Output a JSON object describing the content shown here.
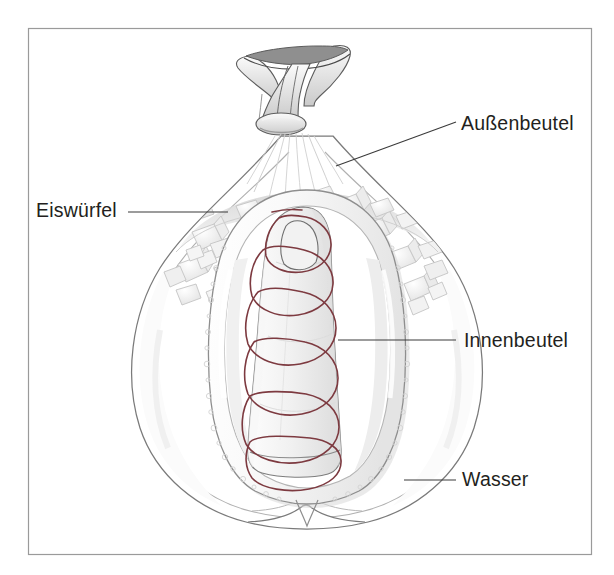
{
  "figure": {
    "name": "replantation-transport-bag-diagram",
    "description_title": "Transport eines Amputats im Doppelbeutel",
    "frame": {
      "border_color": "#9a9a9a",
      "background_color": "#ffffff",
      "x": 28,
      "y": 28,
      "width": 564,
      "height": 527
    },
    "colors": {
      "ink": "#231f20",
      "line": "#6e6e6e",
      "outer_bag_line": "#8a8a8a",
      "inner_bag_line": "#9c9c9c",
      "ice_fill": "#f2f2f2",
      "ice_line": "#c9c9c9",
      "spiral_wrap": "#7d3a40",
      "shadow": "#d8d8d8",
      "bubble": "#e6e6e6"
    },
    "labels": [
      {
        "id": "aussenbeutel",
        "text": "Außenbeutel",
        "target": "outer-bag",
        "leader": {
          "x1": 336,
          "y1": 166,
          "x2": 456,
          "y2": 122
        }
      },
      {
        "id": "eiswuerfel",
        "text": "Eiswürfel",
        "target": "ice-cubes",
        "leader": {
          "x1": 128,
          "y1": 212,
          "x2": 228,
          "y2": 212
        }
      },
      {
        "id": "innenbeutel",
        "text": "Innenbeutel",
        "target": "inner-bag",
        "leader": {
          "x1": 338,
          "y1": 340,
          "x2": 456,
          "y2": 340
        }
      },
      {
        "id": "wasser",
        "text": "Wasser",
        "target": "water",
        "leader": {
          "x1": 404,
          "y1": 480,
          "x2": 456,
          "y2": 480
        }
      }
    ],
    "elements": {
      "outer_bag": {
        "name": "Außenbeutel",
        "note": "knotted plastic bag, pointed top, rounded bottom with V notch"
      },
      "inner_bag": {
        "name": "Innenbeutel",
        "note": "sealed inner bag containing the amputate"
      },
      "ice_cubes": {
        "name": "Eiswürfel",
        "count_visible": 34
      },
      "water": {
        "name": "Wasser",
        "note": "water filling the outer bag"
      },
      "amputate": {
        "name": "Amputat",
        "note": "finger wrapped in spiral dressing"
      },
      "knot": {
        "name": "Knoten",
        "note": "tied neck of outer bag"
      }
    }
  }
}
